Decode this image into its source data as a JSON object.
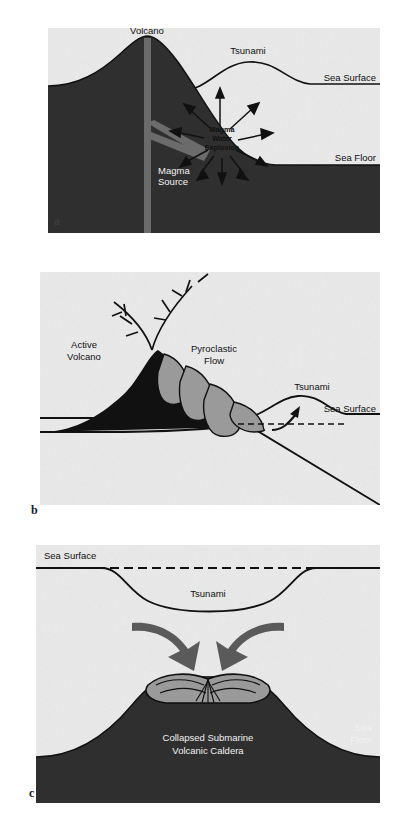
{
  "figure": {
    "panel_labels": {
      "a": "a",
      "b": "b",
      "c": "c"
    },
    "colors": {
      "land_dark": "#2f2f2f",
      "water_light": "#e9e9e9",
      "pyroclastic_gray": "#9a9a9a",
      "arrow_gray": "#5a5a5a",
      "outline_black": "#111111",
      "paper_white": "#ffffff"
    }
  },
  "panel_a": {
    "caption_letter": "a",
    "mechanism": "Submarine magma-water explosion",
    "labels": {
      "volcano": "Volcano",
      "tsunami": "Tsunami",
      "sea_surface": "Sea Surface",
      "sea_floor": "Sea Floor",
      "magma_source": "Magma Source",
      "explosion_line1": "Magma",
      "explosion_line2": "Water",
      "explosion_line3": "Explosion"
    }
  },
  "panel_b": {
    "caption_letter": "b",
    "mechanism": "Pyroclastic flow entering the sea",
    "labels": {
      "active_volcano": "Active Volcano",
      "pyroclastic_flow": "Pyroclastic Flow",
      "tsunami": "Tsunami",
      "sea_surface": "Sea Surface"
    }
  },
  "panel_c": {
    "caption_letter": "c",
    "mechanism": "Submarine caldera collapse",
    "labels": {
      "sea_surface": "Sea Surface",
      "tsunami": "Tsunami",
      "sea_floor": "Sea Floor",
      "caldera_line1": "Collapsed Submarine",
      "caldera_line2": "Volcanic Caldera"
    }
  }
}
